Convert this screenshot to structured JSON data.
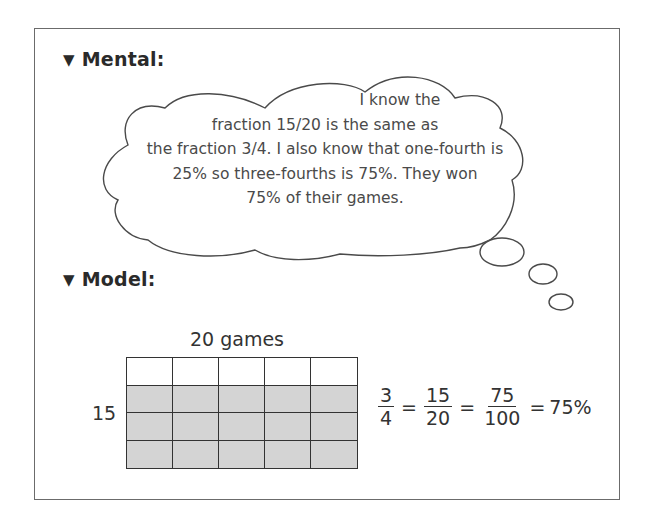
{
  "sections": {
    "mental": {
      "marker": "▼",
      "title": "Mental:"
    },
    "model": {
      "marker": "▼",
      "title": "Model:"
    }
  },
  "thought_bubble": {
    "lines": [
      "I know the",
      "fraction 15/20 is the same as",
      "the fraction 3/4. I also know that one-fourth is",
      "25% so three-fourths is 75%. They won",
      "75% of their games."
    ]
  },
  "model": {
    "top_label": "20 games",
    "side_label": "15",
    "grid": {
      "columns": 5,
      "rows": 4,
      "shaded_rows": 3,
      "shade_color": "#d4d4d4"
    },
    "equation": {
      "fractions": [
        {
          "num": "3",
          "den": "4"
        },
        {
          "num": "15",
          "den": "20"
        },
        {
          "num": "75",
          "den": "100"
        }
      ],
      "equals": "=",
      "result": "75%"
    }
  }
}
